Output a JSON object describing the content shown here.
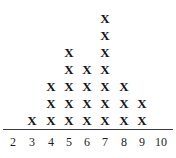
{
  "chart_data": {
    "type": "scatter",
    "plot_style": "dot-plot",
    "title": "",
    "subtitle": "",
    "xlabel": "",
    "ylabel": "",
    "marker": "X",
    "marker_label": "x-mark",
    "categories": [
      "2",
      "3",
      "4",
      "5",
      "6",
      "7",
      "8",
      "9",
      "10"
    ],
    "x": [
      2,
      3,
      4,
      5,
      6,
      7,
      8,
      9,
      10
    ],
    "values": [
      0,
      1,
      3,
      5,
      4,
      7,
      3,
      2,
      0
    ],
    "counts": {
      "2": 0,
      "3": 1,
      "4": 3,
      "5": 5,
      "6": 4,
      "7": 7,
      "8": 3,
      "9": 2,
      "10": 0
    },
    "total_marks": 25,
    "max_count": 7,
    "mode": 7,
    "xlim": [
      2,
      10
    ],
    "ylim": [
      0,
      7
    ],
    "grid": false,
    "legend": false,
    "legend_position": "none",
    "axis": {
      "show_x_axis_line": true,
      "show_y_axis_line": false,
      "tick_labels": [
        "2",
        "3",
        "4",
        "5",
        "6",
        "7",
        "8",
        "9",
        "10"
      ]
    },
    "colors": {
      "marker": "#16161a",
      "axis_line": "#3a3a40",
      "tick_label": "#1d1d22",
      "background": "#ffffff"
    }
  },
  "axis_labels": [
    {
      "text": "2",
      "x": 13
    },
    {
      "text": "3",
      "x": 32
    },
    {
      "text": "4",
      "x": 51
    },
    {
      "text": "5",
      "x": 69
    },
    {
      "text": "6",
      "x": 87
    },
    {
      "text": "7",
      "x": 105
    },
    {
      "text": "8",
      "x": 124
    },
    {
      "text": "9",
      "x": 142
    },
    {
      "text": "10",
      "x": 161
    }
  ],
  "columns": [
    {
      "value": "2",
      "x": 13,
      "count": 0,
      "marks": []
    },
    {
      "value": "3",
      "x": 32,
      "count": 1,
      "marks": [
        "X"
      ]
    },
    {
      "value": "4",
      "x": 51,
      "count": 3,
      "marks": [
        "X",
        "X",
        "X"
      ]
    },
    {
      "value": "5",
      "x": 69,
      "count": 5,
      "marks": [
        "X",
        "X",
        "X",
        "X",
        "X"
      ]
    },
    {
      "value": "6",
      "x": 87,
      "count": 4,
      "marks": [
        "X",
        "X",
        "X",
        "X"
      ]
    },
    {
      "value": "7",
      "x": 105,
      "count": 7,
      "marks": [
        "X",
        "X",
        "X",
        "X",
        "X",
        "X",
        "X"
      ]
    },
    {
      "value": "8",
      "x": 124,
      "count": 3,
      "marks": [
        "X",
        "X",
        "X"
      ]
    },
    {
      "value": "9",
      "x": 142,
      "count": 2,
      "marks": [
        "X",
        "X"
      ]
    },
    {
      "value": "10",
      "x": 161,
      "count": 0,
      "marks": []
    }
  ]
}
